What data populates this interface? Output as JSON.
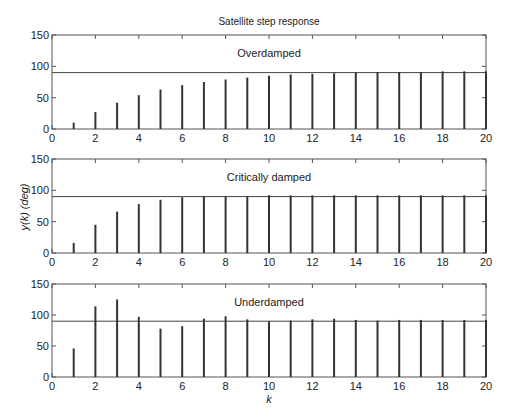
{
  "chart_data": {
    "type": "stem",
    "title": "Satellite step response",
    "xlabel": "k",
    "ylabel": "y(k) (deg)",
    "colors": {
      "stem": "#333333",
      "axis": "#555555",
      "reference": "#444444"
    },
    "panels": [
      {
        "subtitle": "Overdamped",
        "reference": 90,
        "xlim": [
          0,
          20
        ],
        "ylim": [
          0,
          150
        ],
        "xticks": [
          0,
          2,
          4,
          6,
          8,
          10,
          12,
          14,
          16,
          18,
          20
        ],
        "yticks": [
          0,
          50,
          100,
          150
        ],
        "x": [
          1,
          2,
          3,
          4,
          5,
          6,
          7,
          8,
          9,
          10,
          11,
          12,
          13,
          14,
          15,
          16,
          17,
          18,
          19,
          20
        ],
        "values": [
          10,
          27,
          42,
          54,
          63,
          70,
          75,
          79,
          82,
          85,
          87,
          88,
          89,
          90,
          91,
          91,
          91,
          92,
          92,
          92
        ]
      },
      {
        "subtitle": "Critically damped",
        "reference": 90,
        "xlim": [
          0,
          20
        ],
        "ylim": [
          0,
          150
        ],
        "xticks": [
          0,
          2,
          4,
          6,
          8,
          10,
          12,
          14,
          16,
          18,
          20
        ],
        "yticks": [
          0,
          50,
          100,
          150
        ],
        "x": [
          1,
          2,
          3,
          4,
          5,
          6,
          7,
          8,
          9,
          10,
          11,
          12,
          13,
          14,
          15,
          16,
          17,
          18,
          19,
          20
        ],
        "values": [
          16,
          45,
          66,
          78,
          85,
          89,
          91,
          91,
          91,
          92,
          92,
          92,
          92,
          92,
          92,
          92,
          92,
          92,
          92,
          92
        ]
      },
      {
        "subtitle": "Underdamped",
        "reference": 90,
        "xlim": [
          0,
          20
        ],
        "ylim": [
          0,
          150
        ],
        "xticks": [
          0,
          2,
          4,
          6,
          8,
          10,
          12,
          14,
          16,
          18,
          20
        ],
        "yticks": [
          0,
          50,
          100,
          150
        ],
        "x": [
          1,
          2,
          3,
          4,
          5,
          6,
          7,
          8,
          9,
          10,
          11,
          12,
          13,
          14,
          15,
          16,
          17,
          18,
          19,
          20
        ],
        "values": [
          46,
          114,
          125,
          97,
          78,
          82,
          94,
          98,
          93,
          90,
          91,
          93,
          94,
          92,
          91,
          92,
          92,
          92,
          92,
          92
        ]
      }
    ]
  }
}
